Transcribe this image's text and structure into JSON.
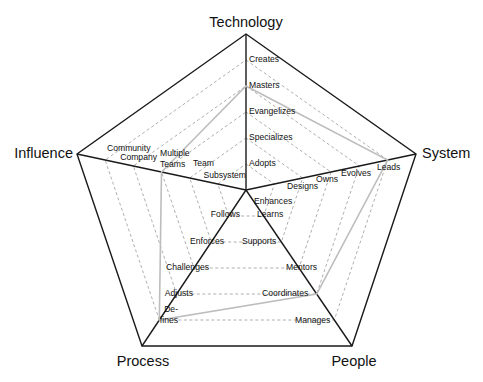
{
  "diagram": {
    "type": "radar-levels",
    "center": [
      246,
      190
    ],
    "levels_count": 5,
    "colors": {
      "frame": "#1a1a1a",
      "ring": "#9a9a9a",
      "profile": "#bdbdbd",
      "text": "#111111"
    },
    "axes": [
      {
        "name": "Technology",
        "vertex": [
          246,
          34
        ],
        "title_pos": [
          246,
          27
        ],
        "title_anchor": "middle",
        "levels": [
          "Adopts",
          "Specializes",
          "Evangelizes",
          "Masters",
          "Creates"
        ]
      },
      {
        "name": "System",
        "vertex": [
          416,
          154
        ],
        "title_pos": [
          422,
          158
        ],
        "title_anchor": "start",
        "levels": [
          "Enhances",
          "Designs",
          "Owns",
          "Evolves",
          "Leads"
        ]
      },
      {
        "name": "People",
        "vertex": [
          352,
          346
        ],
        "title_pos": [
          354,
          366
        ],
        "title_anchor": "middle",
        "levels": [
          "Learns",
          "Supports",
          "Mentors",
          "Coordinates",
          "Manages"
        ]
      },
      {
        "name": "Process",
        "vertex": [
          142,
          346
        ],
        "title_pos": [
          143,
          366
        ],
        "title_anchor": "middle",
        "levels": [
          "Follows",
          "Enforces",
          "Challenges",
          "Adjusts",
          "De-fines"
        ]
      },
      {
        "name": "Influence",
        "vertex": [
          77,
          154
        ],
        "title_pos": [
          73,
          158
        ],
        "title_anchor": "end",
        "levels": [
          "Subsystem",
          "Team",
          "Multiple Teams",
          "Company",
          "Community"
        ]
      }
    ],
    "profile": {
      "Technology": "Masters",
      "System": "Leads",
      "People": "Coordinates",
      "Process": "De-fines",
      "Influence": "Multiple Teams"
    },
    "profile_levels": [
      4,
      5,
      4,
      5,
      3
    ],
    "label_positions": {
      "Technology": [
        [
          249,
          166,
          "start"
        ],
        [
          249,
          140,
          "start"
        ],
        [
          249,
          114,
          "start"
        ],
        [
          249,
          88,
          "start"
        ],
        [
          249,
          62,
          "start"
        ]
      ],
      "System": [
        [
          254,
          204,
          "start"
        ],
        [
          287,
          189,
          "start"
        ],
        [
          316,
          182,
          "start"
        ],
        [
          341,
          176,
          "start"
        ],
        [
          377,
          170,
          "start"
        ]
      ],
      "People": [
        [
          257,
          217,
          "start"
        ],
        [
          242,
          244,
          "start"
        ],
        [
          286,
          270,
          "start"
        ],
        [
          262,
          296,
          "start"
        ],
        [
          295,
          323,
          "start"
        ]
      ],
      "Process": [
        [
          240,
          217,
          "end"
        ],
        [
          224,
          244,
          "end"
        ],
        [
          209,
          270,
          "end"
        ],
        [
          193,
          296,
          "end"
        ],
        [
          178,
          312,
          "end"
        ]
      ],
      "Influence": [
        [
          246,
          178,
          "end"
        ],
        [
          214,
          166,
          "end"
        ],
        [
          160,
          156,
          "start"
        ],
        [
          157,
          160,
          "end"
        ],
        [
          107,
          151,
          "start"
        ]
      ]
    },
    "extra_label_lines": {
      "Multiple Teams": [
        "Multiple",
        "Teams"
      ],
      "De-fines": [
        "De-",
        "fines"
      ]
    }
  }
}
